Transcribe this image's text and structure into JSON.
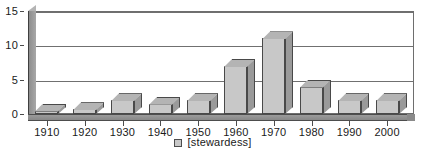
{
  "chart_data": {
    "type": "bar",
    "title": "",
    "subtitle": "",
    "xlabel": "",
    "ylabel": "",
    "categories": [
      "1910",
      "1920",
      "1930",
      "1940",
      "1950",
      "1960",
      "1970",
      "1980",
      "1990",
      "2000"
    ],
    "series": [
      {
        "name": "[stewardess]",
        "values": [
          0.5,
          0.7,
          2,
          1.5,
          2,
          7,
          11,
          4,
          2,
          2
        ]
      }
    ],
    "ylim": [
      0,
      15
    ],
    "yticks": [
      0,
      5,
      10,
      15
    ],
    "ytick_labels": [
      "0",
      "5",
      "10",
      "15"
    ],
    "grid": true,
    "grid_axis": "y",
    "legend": {
      "position": "bottom-center",
      "entries": [
        {
          "label": "[stewardess]",
          "color": "#c8c8c8"
        }
      ]
    },
    "style": {
      "three_d": true,
      "bar_face_color": "#c8c8c8",
      "bar_side_color": "#9a9a9a",
      "bar_top_color": "#b4b4b4",
      "bar_edge_color": "#494949",
      "axis_color": "#4d4d4d",
      "grid_color": "#707070",
      "background": "#ffffff",
      "text_color": "#1a1a1a"
    }
  }
}
